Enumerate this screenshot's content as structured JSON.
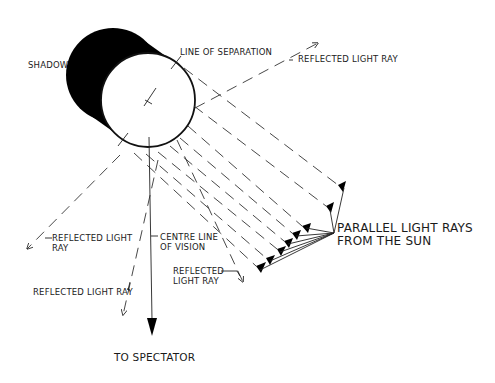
{
  "diagram": {
    "labels": {
      "shadow": "SHADOW",
      "line_of_separation": "LINE OF SEPARATION",
      "reflected_top_right": "REFLECTED LIGHT RAY",
      "reflected_left_line1": "REFLECTED LIGHT",
      "reflected_left_line2": "RAY",
      "centre_line1": "CENTRE LINE",
      "centre_line2": "OF VISION",
      "reflected_mid_left": "REFLECTED LIGHT RAY",
      "reflected_right_line1": "REFLECTED",
      "reflected_right_line2": "LIGHT RAY",
      "parallel_line1": "PARALLEL LIGHT RAYS",
      "parallel_line2": "FROM THE SUN",
      "to_spectator": "TO SPECTATOR"
    },
    "colors": {
      "ink": "#1a1a1a",
      "shadow": "#000000",
      "background": "#ffffff"
    },
    "parallel_ray_count": 8
  }
}
